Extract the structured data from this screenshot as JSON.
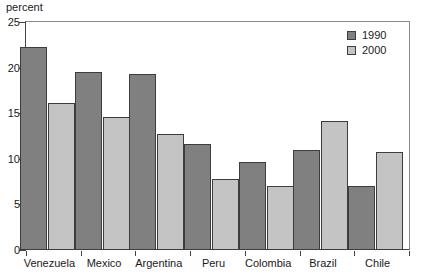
{
  "chart_data": {
    "type": "bar",
    "title": "",
    "subtitle": "",
    "xlabel": "",
    "ylabel": "percent",
    "ylim": [
      0,
      25
    ],
    "yticks": [
      0,
      5,
      10,
      15,
      20,
      25
    ],
    "ytick_labels": [
      "0",
      "5",
      "10",
      "15",
      "20",
      "25"
    ],
    "grid": false,
    "legend_position": "top-right",
    "categories": [
      "Venezuela",
      "Mexico",
      "Argentina",
      "Peru",
      "Colombia",
      "Brazil",
      "Chile"
    ],
    "series": [
      {
        "name": "1990",
        "color": "#808080",
        "values": [
          22.3,
          19.5,
          19.3,
          11.6,
          9.6,
          11.0,
          7.0
        ]
      },
      {
        "name": "2000",
        "color": "#c4c4c4",
        "values": [
          16.1,
          14.6,
          12.7,
          7.8,
          7.0,
          14.2,
          10.8
        ]
      }
    ]
  }
}
